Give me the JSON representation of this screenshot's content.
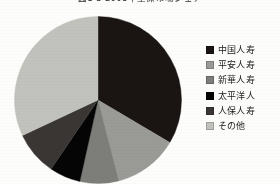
{
  "title": "図1-3 2008年生保市場シェア",
  "chart_data": {
    "type": "pie",
    "title": "図1-3 2008年生保市場シェア",
    "legend_position": "right",
    "start_angle_deg": 0,
    "direction": "clockwise",
    "labels": [
      "中国人寿",
      "平安人寿",
      "新華人寿",
      "太平洋人",
      "人保人寿",
      "その他"
    ],
    "values": [
      33.5,
      12.5,
      7.5,
      6.0,
      8.5,
      32.0
    ],
    "colors": [
      "#1a1512",
      "#9a9a96",
      "#7d7d7a",
      "#050505",
      "#3a3634",
      "#c2c2bd"
    ],
    "slices": [
      {
        "label": "中国人寿",
        "value": 33.5,
        "color": "#1a1512",
        "start_deg": 0,
        "end_deg": 120.6
      },
      {
        "label": "平安人寿",
        "value": 12.5,
        "color": "#9a9a96",
        "start_deg": 120.6,
        "end_deg": 165.6
      },
      {
        "label": "新華人寿",
        "value": 7.5,
        "color": "#7d7d7a",
        "start_deg": 165.6,
        "end_deg": 192.6
      },
      {
        "label": "太平洋人",
        "value": 6.0,
        "color": "#050505",
        "start_deg": 192.6,
        "end_deg": 214.2
      },
      {
        "label": "人保人寿",
        "value": 8.5,
        "color": "#3a3634",
        "start_deg": 214.2,
        "end_deg": 244.8
      },
      {
        "label": "その他",
        "value": 32.0,
        "color": "#c2c2bd",
        "start_deg": 244.8,
        "end_deg": 360.0
      }
    ]
  },
  "legend": {
    "items": [
      {
        "label": "中国人寿",
        "color": "#1a1512"
      },
      {
        "label": "平安人寿",
        "color": "#9a9a96"
      },
      {
        "label": "新華人寿",
        "color": "#7d7d7a"
      },
      {
        "label": "太平洋人",
        "color": "#050505"
      },
      {
        "label": "人保人寿",
        "color": "#3a3634"
      },
      {
        "label": "その他",
        "color": "#c2c2bd"
      }
    ]
  }
}
